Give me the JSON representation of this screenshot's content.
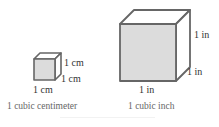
{
  "small_cube": {
    "label_height": "1 cm",
    "label_depth": "1 cm",
    "label_width": "1 cm",
    "caption": "1 cubic centimeter",
    "face_color": "#dcdcdc",
    "edge_color": "#666666"
  },
  "large_cube": {
    "label_height": "1 in",
    "label_depth": "1 in",
    "label_width": "1 in",
    "caption": "1 cubic inch",
    "face_color": "#dcdcdc",
    "edge_color": "#666666"
  }
}
